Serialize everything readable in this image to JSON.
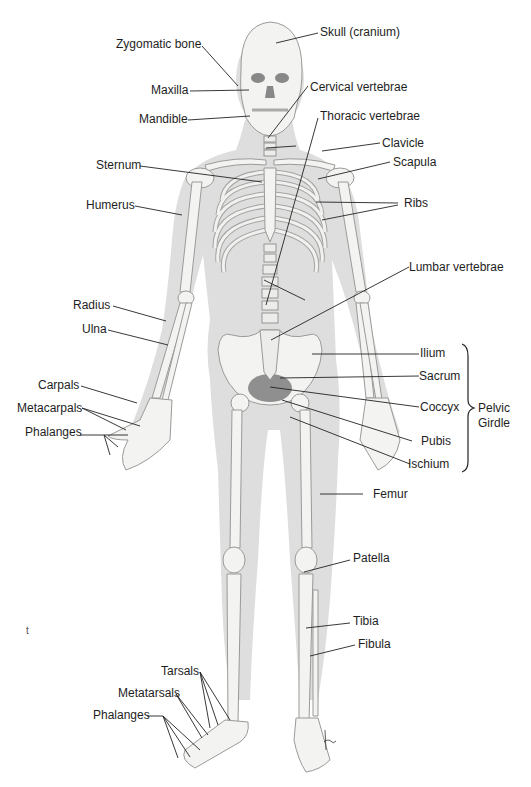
{
  "figure": {
    "type": "anatomical-diagram",
    "colors": {
      "background": "#ffffff",
      "body_silhouette": "#dcdcdc",
      "bone": "#f3f3f1",
      "bone_outline": "#9a9a98",
      "pelvic_cavity": "#8f8f8f",
      "leader_line": "#222222",
      "text": "#1e1e1e"
    }
  },
  "labels": {
    "skull": "Skull (cranium)",
    "zygomatic": "Zygomatic bone",
    "maxilla": "Maxilla",
    "mandible": "Mandible",
    "cervical": "Cervical vertebrae",
    "thoracic": "Thoracic vertebrae",
    "clavicle": "Clavicle",
    "scapula": "Scapula",
    "sternum": "Sternum",
    "humerus": "Humerus",
    "ribs": "Ribs",
    "lumbar": "Lumbar vertebrae",
    "radius": "Radius",
    "ulna": "Ulna",
    "ilium": "Ilium",
    "sacrum": "Sacrum",
    "carpals": "Carpals",
    "metacarpals": "Metacarpals",
    "coccyx": "Coccyx",
    "phalanges_hand": "Phalanges",
    "pubis": "Pubis",
    "ischium": "Ischium",
    "femur": "Femur",
    "patella": "Patella",
    "tibia": "Tibia",
    "fibula": "Fibula",
    "tarsals": "Tarsals",
    "metatarsals": "Metatarsals",
    "phalanges_foot": "Phalanges"
  },
  "group": {
    "pelvic_girdle_line1": "Pelvic",
    "pelvic_girdle_line2": "Girdle"
  },
  "misc": {
    "margin_mark": "t",
    "signature": "tna"
  }
}
